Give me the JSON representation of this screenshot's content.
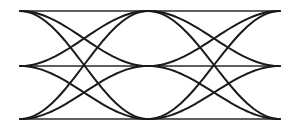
{
  "diagram": {
    "type": "eye-diagram",
    "levels": 3,
    "level_y": [
      11,
      66,
      119
    ],
    "segment_x": [
      20,
      148,
      280
    ],
    "stroke_color": "#1a1a1a",
    "background": "#ffffff"
  }
}
